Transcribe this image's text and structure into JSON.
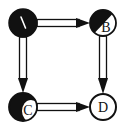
{
  "diagram": {
    "type": "directed-graph",
    "nodes": [
      {
        "id": "A",
        "label": "\\",
        "x": 23,
        "y": 23,
        "r": 14,
        "fill": "black"
      },
      {
        "id": "B",
        "label": "B",
        "x": 103,
        "y": 23,
        "r": 13,
        "fill": "half"
      },
      {
        "id": "C",
        "label": "C",
        "x": 23,
        "y": 107,
        "r": 14,
        "fill": "mostly-black"
      },
      {
        "id": "D",
        "label": "D",
        "x": 103,
        "y": 107,
        "r": 13,
        "fill": "white"
      }
    ],
    "edges": [
      {
        "from": "A",
        "to": "B"
      },
      {
        "from": "A",
        "to": "C"
      },
      {
        "from": "B",
        "to": "D"
      },
      {
        "from": "C",
        "to": "D"
      }
    ],
    "colors": {
      "ink": "#111111",
      "paper": "#ffffff"
    }
  }
}
